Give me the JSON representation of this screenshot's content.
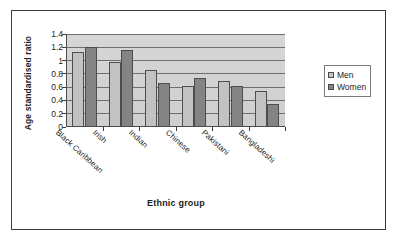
{
  "figure": {
    "background_color": "#FFFFFF",
    "border_color": "#3B3B3B",
    "plot_area_color": "#D2D2D2",
    "gridline_color": "#6E6E6E"
  },
  "chart_data": {
    "type": "bar",
    "title": "",
    "subtitle": "",
    "xlabel": "Ethnic group",
    "ylabel": "Age standardised ratio",
    "categories": [
      "Black Caribbean",
      "Irish",
      "Indian",
      "Chinese",
      "Pakistani",
      "Bangladeshi"
    ],
    "series": [
      {
        "name": "Men",
        "color": "#C2C2C2",
        "values": [
          1.13,
          0.98,
          0.86,
          0.61,
          0.69,
          0.54
        ]
      },
      {
        "name": "Women",
        "color": "#848484",
        "values": [
          1.21,
          1.16,
          0.66,
          0.74,
          0.62,
          0.34
        ]
      }
    ],
    "ylim": [
      0,
      1.4
    ],
    "ytick_step": 0.2,
    "ytick_labels": [
      "1.4",
      "1.2",
      "1",
      "0.8",
      "0.6",
      "0.4",
      "0.2",
      "0"
    ],
    "ytick_values": [
      1.4,
      1.2,
      1.0,
      0.8,
      0.6,
      0.4,
      0.2,
      0
    ],
    "grid": true,
    "grid_axis": "y",
    "legend_position": "right",
    "legend_entries": [
      "Men",
      "Women"
    ],
    "bar_group_mode": "clustered",
    "annotations": []
  },
  "legend": {
    "items": [
      {
        "label": "Men",
        "marker": "square-swatch-light-gray"
      },
      {
        "label": "Women",
        "marker": "square-swatch-dark-gray"
      }
    ]
  }
}
